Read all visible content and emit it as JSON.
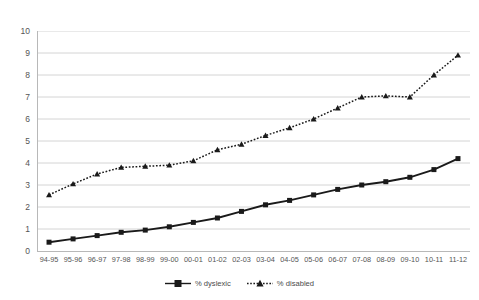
{
  "chart_data": {
    "type": "line",
    "title": "",
    "subtitle": "",
    "xlabel": "",
    "ylabel": "",
    "ylim": [
      0,
      10
    ],
    "ytick_step": 1,
    "yticks": [
      "10",
      "9",
      "8",
      "7",
      "6",
      "5",
      "4",
      "3",
      "2",
      "1",
      "0"
    ],
    "grid": "horizontal",
    "legend_position": "bottom-center",
    "categories": [
      "94-95",
      "95-96",
      "96-97",
      "97-98",
      "98-99",
      "99-00",
      "00-01",
      "01-02",
      "02-03",
      "03-04",
      "04-05",
      "05-06",
      "06-07",
      "07-08",
      "08-09",
      "09-10",
      "10-11",
      "11-12"
    ],
    "series": [
      {
        "name": "% dyslexic",
        "marker": "square",
        "line_style": "solid",
        "color": "#1a1a1a",
        "values": [
          0.4,
          0.55,
          0.7,
          0.85,
          0.95,
          1.1,
          1.3,
          1.5,
          1.8,
          2.1,
          2.3,
          2.55,
          2.8,
          3.0,
          3.15,
          3.35,
          3.7,
          4.2
        ]
      },
      {
        "name": "% disabled",
        "marker": "triangle",
        "line_style": "dotted",
        "color": "#1a1a1a",
        "values": [
          2.55,
          3.05,
          3.5,
          3.8,
          3.85,
          3.9,
          4.1,
          4.6,
          4.85,
          5.25,
          5.6,
          6.0,
          6.5,
          7.0,
          7.05,
          7.0,
          8.0,
          8.9
        ]
      }
    ]
  },
  "legend": {
    "items": [
      {
        "label": "% dyslexic",
        "marker": "square-marker-icon",
        "style": "solid"
      },
      {
        "label": "% disabled",
        "marker": "triangle-marker-icon",
        "style": "dotted"
      }
    ]
  },
  "colors": {
    "series_line": "#1a1a1a",
    "gridline": "#d4d4d4",
    "axis": "#b8b8b8",
    "tick_label": "#555555",
    "background": "#ffffff"
  }
}
